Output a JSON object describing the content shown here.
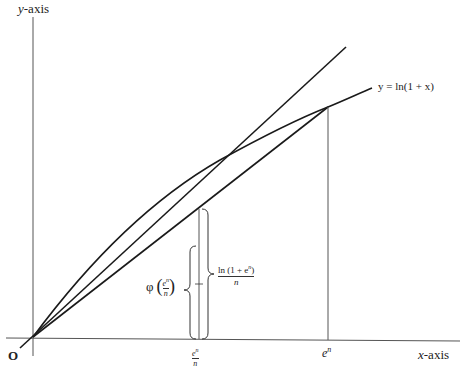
{
  "diagram": {
    "axes": {
      "y_label_var": "y",
      "y_label_text": "-axis",
      "x_label_var": "x",
      "x_label_text": "-axis",
      "origin_label": "O"
    },
    "curve_label": "y = ln(1 + x)",
    "x_ticks": {
      "en_over_n_num": "e",
      "en_over_n_sup": "n",
      "en_over_n_den": "n",
      "en_base": "e",
      "en_sup": "n"
    },
    "brace_labels": {
      "phi_symbol": "φ",
      "phi_arg_num": "e",
      "phi_arg_sup": "n",
      "phi_arg_den": "n",
      "ln_num": "ln (1 + e",
      "ln_num_sup": "n",
      "ln_num_close": ")",
      "ln_den": "n"
    },
    "colors": {
      "line": "#1a1a1a",
      "axis": "#555555",
      "text": "#222222"
    }
  }
}
